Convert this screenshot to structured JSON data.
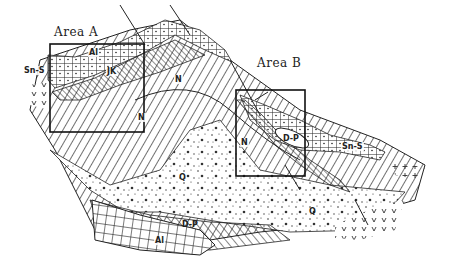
{
  "figure": {
    "type": "geological-map-sketch",
    "areas": [
      {
        "id": "A",
        "title": "Area A"
      },
      {
        "id": "B",
        "title": "Area B"
      }
    ],
    "unit_labels": {
      "al_top": "Al",
      "sn_s_left": "Sn-S",
      "jk": "JK",
      "n_top": "N",
      "n_area_a_right": "N",
      "n_area_a_bottom": "N",
      "n_area_b": "N",
      "d_p_area_b": "D-P",
      "sn_s_right": "Sn-S",
      "q_center": "Q",
      "q_right": "Q",
      "d_p_bottom": "D-P",
      "al_bottom": "Al"
    },
    "colors": {
      "ink": "#222222",
      "paper": "#ffffff"
    }
  }
}
